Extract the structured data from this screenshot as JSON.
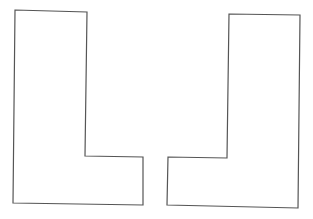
{
  "canvas": {
    "width": 313,
    "height": 219,
    "background": "#ffffff"
  },
  "stroke_color": "#555555",
  "shapes": [
    {
      "name": "L-shape",
      "points": "15,10 87,12 85,156 143,157 143,205 13,203"
    },
    {
      "name": "J-shape (mirrored L)",
      "points": "229,14 300,15 298,208 167,205 168,157 227,158"
    }
  ]
}
